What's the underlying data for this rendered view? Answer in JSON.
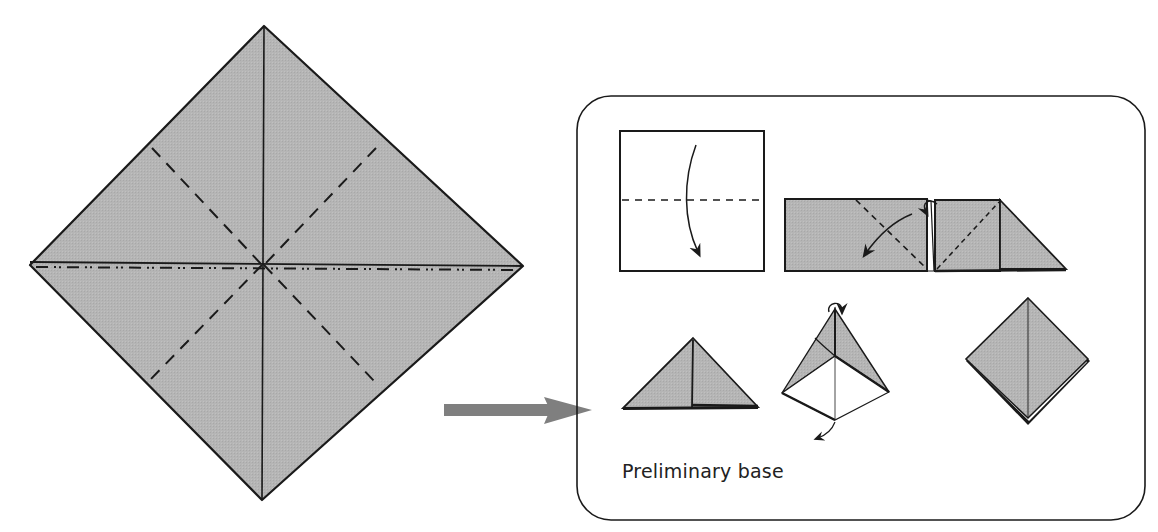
{
  "figure": {
    "title": "Preliminary base",
    "colors": {
      "paper_fill": "#b3b3b3",
      "line": "#1a1a1a",
      "arrow": "#808080",
      "background": "#ffffff",
      "blank_paper": "#ffffff"
    },
    "main_diagram": {
      "shape": "square-rotated-45",
      "creases": [
        {
          "type": "valley-solid",
          "orientation": "vertical"
        },
        {
          "type": "mountain-dash-dot",
          "orientation": "horizontal"
        },
        {
          "type": "valley-dashed",
          "orientation": "diagonal-nw-se"
        },
        {
          "type": "valley-dashed",
          "orientation": "diagonal-ne-sw"
        }
      ]
    },
    "transition_arrow": {
      "direction": "right",
      "icon": "right-arrow-icon"
    },
    "steps_box": {
      "caption": "Preliminary base",
      "steps": [
        {
          "index": 1,
          "description": "White square, valley-fold top edge down to bottom along dashed line",
          "icon": "fold-down-arrow-icon"
        },
        {
          "index": 2,
          "description": "Folded rectangle, valley-fold diagonal toward lower-left",
          "icon": "curved-arrow-icon"
        },
        {
          "index": 3,
          "description": "Rectangle with right triangle flap, fold behind",
          "icon": "fold-behind-arrow-icon"
        },
        {
          "index": 4,
          "description": "Triangle (waterbomb shape)"
        },
        {
          "index": 5,
          "description": "Opening pyramid, squash fold",
          "icon": "rotate-arrow-icon"
        },
        {
          "index": 6,
          "description": "Completed preliminary base (diamond)"
        }
      ]
    }
  }
}
